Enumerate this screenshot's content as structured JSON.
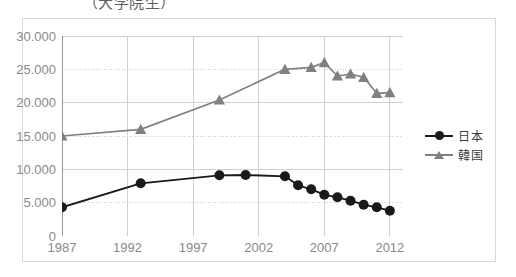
{
  "chart_data": {
    "type": "line",
    "title": "（大学院生）",
    "xlabel": "",
    "ylabel": "",
    "xlim": [
      1987,
      2013
    ],
    "ylim": [
      0,
      30000
    ],
    "grid": true,
    "legend_position": "right",
    "y_ticks": [
      "0",
      "5.000",
      "10.000",
      "15.000",
      "20.000",
      "25.000",
      "30.000"
    ],
    "y_tick_values": [
      0,
      5000,
      10000,
      15000,
      20000,
      25000,
      30000
    ],
    "x_ticks": [
      "1987",
      "1992",
      "1997",
      "2002",
      "2007",
      "2012"
    ],
    "x_tick_values": [
      1987,
      1992,
      1997,
      2002,
      2007,
      2012
    ],
    "x_minor_ticks": [
      1988,
      1989,
      1990,
      1991,
      1993,
      1994,
      1995,
      1996,
      1998,
      1999,
      2000,
      2001,
      2003,
      2004,
      2005,
      2006,
      2008,
      2009,
      2010,
      2011,
      2013
    ],
    "series": [
      {
        "name": "日本",
        "color": "#1a1a1a",
        "marker": "circle",
        "x": [
          1987,
          1993,
          1999,
          2001,
          2004,
          2005,
          2006,
          2007,
          2008,
          2009,
          2010,
          2011,
          2012
        ],
        "values": [
          4300,
          7900,
          9100,
          9150,
          8950,
          7600,
          7000,
          6200,
          5800,
          5300,
          4700,
          4300,
          3800
        ]
      },
      {
        "name": "韓国",
        "color": "#808080",
        "marker": "triangle",
        "x": [
          1987,
          1993,
          1999,
          2004,
          2006,
          2007,
          2008,
          2009,
          2010,
          2011,
          2012
        ],
        "values": [
          15000,
          16000,
          20400,
          25000,
          25300,
          26000,
          24000,
          24300,
          23800,
          21400,
          21500
        ]
      }
    ]
  },
  "legend": {
    "items": [
      {
        "label": "日本",
        "marker": "circle",
        "color": "#1a1a1a"
      },
      {
        "label": "韓国",
        "marker": "triangle",
        "color": "#808080"
      }
    ]
  }
}
